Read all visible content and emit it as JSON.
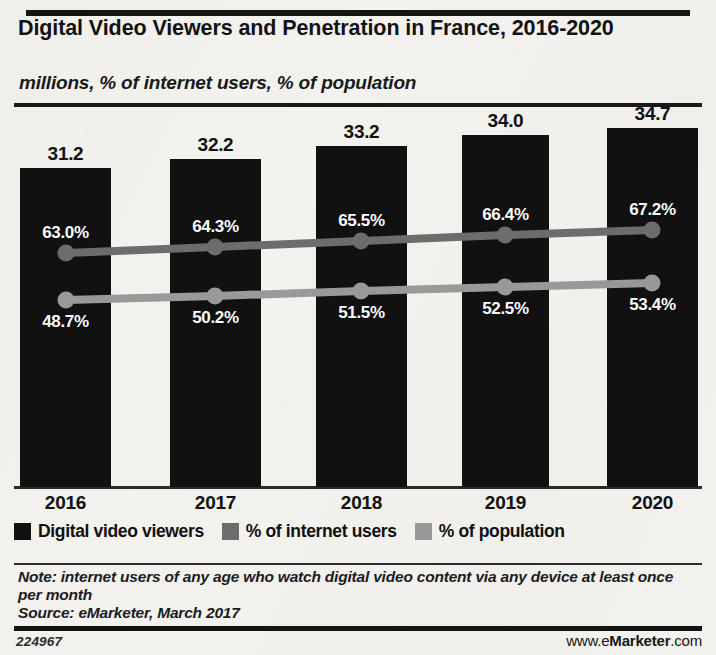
{
  "header": {
    "title": "Digital Video Viewers and Penetration in France, 2016-2020",
    "subtitle": "millions, % of internet users, % of population"
  },
  "legend": {
    "items": [
      {
        "label": "Digital video viewers",
        "color": "#111111",
        "name": "legend-digital-video-viewers"
      },
      {
        "label": "% of internet users",
        "color": "#6d6d6d",
        "name": "legend-internet-users"
      },
      {
        "label": "% of population",
        "color": "#9a9a9a",
        "name": "legend-population"
      }
    ]
  },
  "note": {
    "text": "Note: internet users of any age who watch digital video content via any device at least once per month",
    "source": "Source: eMarketer, March 2017"
  },
  "footer": {
    "chart_id": "224967",
    "url_prefix": "www.e",
    "url_brand": "Marketer",
    "url_suffix": ".com"
  },
  "chart_data": {
    "type": "bar",
    "title": "Digital Video Viewers and Penetration in France, 2016-2020",
    "subtitle": "millions, % of internet users, % of population",
    "xlabel": "",
    "ylabel": "millions, % of internet users, % of population",
    "categories": [
      "2016",
      "2017",
      "2018",
      "2019",
      "2020"
    ],
    "grid": false,
    "legend_position": "bottom",
    "ylim": [
      0,
      36
    ],
    "series": [
      {
        "name": "Digital video viewers",
        "unit": "millions",
        "chart_type": "bar",
        "color": "#111111",
        "values": [
          31.2,
          32.2,
          33.2,
          34.0,
          34.7
        ],
        "labels": [
          "31.2",
          "32.2",
          "33.2",
          "34.0",
          "34.7"
        ]
      },
      {
        "name": "% of internet users",
        "unit": "percent",
        "chart_type": "line",
        "color": "#6d6d6d",
        "values": [
          63.0,
          64.3,
          65.5,
          66.4,
          67.2
        ],
        "labels": [
          "63.0%",
          "64.3%",
          "65.5%",
          "66.4%",
          "67.2%"
        ]
      },
      {
        "name": "% of population",
        "unit": "percent",
        "chart_type": "line",
        "color": "#9a9a9a",
        "values": [
          48.7,
          50.2,
          51.5,
          52.5,
          53.4
        ],
        "labels": [
          "48.7%",
          "50.2%",
          "51.5%",
          "52.5%",
          "53.4%"
        ]
      }
    ],
    "annotations": [
      "Note: internet users of any age who watch digital video content via any device at least once per month",
      "Source: eMarketer, March 2017"
    ]
  },
  "geometry": {
    "bars": [
      {
        "x": 20,
        "y": 168,
        "w": 91
      },
      {
        "x": 170,
        "y": 159,
        "w": 91
      },
      {
        "x": 316,
        "y": 146,
        "w": 91
      },
      {
        "x": 462,
        "y": 135,
        "w": 87
      },
      {
        "x": 607,
        "y": 128,
        "w": 91
      }
    ],
    "baseline": 487,
    "line_internet_y": [
      253,
      247,
      241,
      235,
      230
    ],
    "line_population_y": [
      300,
      296,
      291,
      287,
      283
    ],
    "marker_x": [
      66,
      215,
      361,
      505,
      652
    ]
  }
}
